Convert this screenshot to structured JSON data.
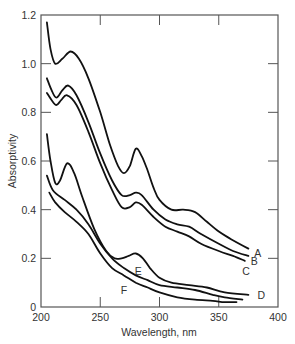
{
  "chart_data": {
    "type": "line",
    "title": "",
    "xlabel": "Wavelength, nm",
    "ylabel": "Absorptivity",
    "xlim": [
      200,
      400
    ],
    "ylim": [
      0,
      1.2
    ],
    "xticks": [
      200,
      250,
      300,
      350,
      400
    ],
    "yticks": [
      0,
      0.2,
      0.4,
      0.6,
      0.8,
      1.0,
      1.2
    ],
    "xtick_labels": [
      "200",
      "250",
      "300",
      "350",
      "400"
    ],
    "ytick_labels": [
      "0",
      "0.2",
      "0.4",
      "0.6",
      "0.8",
      "1.0",
      "1.2"
    ],
    "grid": false,
    "legend": "inline curve labels",
    "series": [
      {
        "name": "A",
        "x": [
          205,
          208,
          212,
          218,
          225,
          232,
          240,
          250,
          258,
          265,
          270,
          275,
          280,
          285,
          290,
          295,
          300,
          310,
          320,
          330,
          340,
          350,
          360,
          375
        ],
        "y": [
          1.17,
          1.06,
          1.0,
          1.02,
          1.05,
          1.02,
          0.94,
          0.8,
          0.67,
          0.58,
          0.55,
          0.58,
          0.65,
          0.62,
          0.56,
          0.49,
          0.44,
          0.4,
          0.4,
          0.39,
          0.35,
          0.31,
          0.28,
          0.24
        ]
      },
      {
        "name": "B",
        "x": [
          205,
          209,
          213,
          218,
          223,
          230,
          240,
          250,
          260,
          268,
          275,
          280,
          285,
          295,
          305,
          315,
          325,
          335,
          350,
          362,
          375
        ],
        "y": [
          0.94,
          0.89,
          0.86,
          0.89,
          0.91,
          0.87,
          0.76,
          0.63,
          0.52,
          0.46,
          0.46,
          0.47,
          0.46,
          0.4,
          0.36,
          0.34,
          0.33,
          0.3,
          0.26,
          0.23,
          0.21
        ]
      },
      {
        "name": "C",
        "x": [
          205,
          209,
          213,
          217,
          222,
          230,
          240,
          250,
          260,
          268,
          275,
          280,
          285,
          295,
          305,
          315,
          325,
          335,
          350,
          362,
          372
        ],
        "y": [
          0.88,
          0.85,
          0.83,
          0.85,
          0.87,
          0.83,
          0.72,
          0.59,
          0.48,
          0.41,
          0.41,
          0.43,
          0.42,
          0.37,
          0.33,
          0.31,
          0.29,
          0.26,
          0.23,
          0.21,
          0.19
        ]
      },
      {
        "name": "D",
        "x": [
          205,
          208,
          212,
          216,
          222,
          228,
          235,
          245,
          255,
          262,
          268,
          274,
          280,
          286,
          292,
          300,
          310,
          325,
          340,
          355,
          375
        ],
        "y": [
          0.71,
          0.6,
          0.51,
          0.52,
          0.59,
          0.55,
          0.45,
          0.32,
          0.23,
          0.2,
          0.2,
          0.21,
          0.22,
          0.2,
          0.16,
          0.12,
          0.1,
          0.09,
          0.08,
          0.06,
          0.05
        ]
      },
      {
        "name": "E",
        "x": [
          205,
          210,
          220,
          230,
          240,
          250,
          260,
          270,
          280,
          290,
          300,
          315,
          330,
          345,
          355,
          370
        ],
        "y": [
          0.54,
          0.48,
          0.44,
          0.4,
          0.34,
          0.26,
          0.2,
          0.16,
          0.13,
          0.11,
          0.09,
          0.08,
          0.07,
          0.05,
          0.04,
          0.03
        ]
      },
      {
        "name": "F",
        "x": [
          207,
          212,
          220,
          230,
          240,
          250,
          260,
          270,
          280,
          290,
          300,
          315,
          330,
          345,
          355,
          365
        ],
        "y": [
          0.47,
          0.43,
          0.39,
          0.35,
          0.3,
          0.22,
          0.16,
          0.13,
          0.1,
          0.08,
          0.06,
          0.04,
          0.03,
          0.025,
          0.02,
          0.02
        ]
      }
    ],
    "annotations": [
      {
        "text": "A",
        "x": 383,
        "y": 0.22
      },
      {
        "text": "B",
        "x": 380,
        "y": 0.19
      },
      {
        "text": "C",
        "x": 373,
        "y": 0.15
      },
      {
        "text": "D",
        "x": 386,
        "y": 0.05
      },
      {
        "text": "E",
        "x": 282,
        "y": 0.15
      },
      {
        "text": "F",
        "x": 270,
        "y": 0.07
      }
    ]
  },
  "colors": {
    "line": "#111111",
    "axis": "#555555",
    "text": "#333333",
    "background": "#ffffff"
  }
}
